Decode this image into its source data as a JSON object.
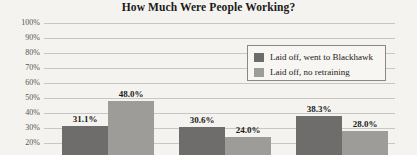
{
  "chart_data": {
    "type": "bar",
    "title": "How Much Were People Working?",
    "xlabel": "",
    "ylabel": "",
    "ylim": [
      20,
      100
    ],
    "y_ticks": [
      "100%",
      "90%",
      "80%",
      "70%",
      "60%",
      "50%",
      "40%",
      "30%",
      "20%"
    ],
    "grid": true,
    "legend_position": "upper-right",
    "categories": [
      "Group 1",
      "Group 2",
      "Group 3"
    ],
    "series": [
      {
        "name": "Laid off, went to Blackhawk",
        "color": "#6e6d6b",
        "values": [
          31.1,
          30.6,
          38.3
        ],
        "labels": [
          "31.1%",
          "30.6%",
          "38.3%"
        ]
      },
      {
        "name": "Laid off, no retraining",
        "color": "#9d9c99",
        "values": [
          48.0,
          24.0,
          28.0
        ],
        "labels": [
          "48.0%",
          "24.0%",
          "28.0%"
        ]
      }
    ]
  },
  "legend": {
    "items": [
      {
        "label": "Laid off, went to Blackhawk",
        "swatch": "dark"
      },
      {
        "label": "Laid off, no retraining",
        "swatch": "light"
      }
    ]
  }
}
